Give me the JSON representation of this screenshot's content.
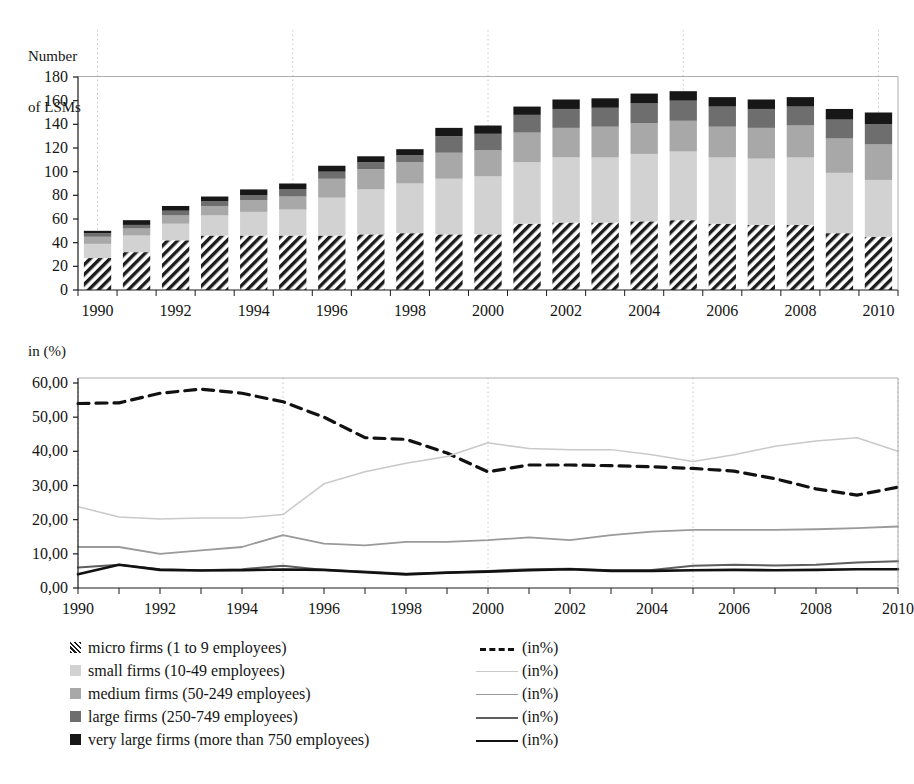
{
  "chart_data": [
    {
      "type": "bar",
      "stacked": true,
      "title": "",
      "ylabel": "Number\nof LSMs",
      "xlabel": "",
      "ylim": [
        0,
        180
      ],
      "yticks": [
        0,
        20,
        40,
        60,
        80,
        100,
        120,
        140,
        160,
        180
      ],
      "ytick_labels": [
        "0",
        "20",
        "40",
        "60",
        "80",
        "100",
        "120",
        "140",
        "160",
        "180"
      ],
      "categories": [
        1990,
        1991,
        1992,
        1993,
        1994,
        1995,
        1996,
        1997,
        1998,
        1999,
        2000,
        2001,
        2002,
        2003,
        2004,
        2005,
        2006,
        2007,
        2008,
        2009,
        2010
      ],
      "xtick_labels": [
        "1990",
        "1992",
        "1994",
        "1996",
        "1998",
        "2000",
        "2002",
        "2004",
        "2006",
        "2008",
        "2010"
      ],
      "grid": "vertical dotted every 5 years",
      "series": [
        {
          "name": "micro firms (1 to 9 employees)",
          "key": "micro",
          "fill": "hatch",
          "values": [
            27,
            32,
            42,
            46,
            46,
            46,
            46,
            47,
            48,
            47,
            47,
            56,
            57,
            57,
            58,
            59,
            56,
            55,
            55,
            48,
            45
          ]
        },
        {
          "name": "small firms (10-49 employees)",
          "key": "small",
          "fill": "#d2d2d2",
          "values": [
            12,
            14,
            14,
            17,
            20,
            22,
            32,
            38,
            42,
            47,
            49,
            52,
            55,
            55,
            57,
            58,
            56,
            56,
            57,
            51,
            48
          ]
        },
        {
          "name": "medium firms (50-249 employees)",
          "key": "medium",
          "fill": "#a8a8a8",
          "values": [
            6,
            6,
            7,
            8,
            10,
            11,
            16,
            17,
            18,
            22,
            22,
            25,
            25,
            26,
            26,
            26,
            26,
            26,
            27,
            29,
            30
          ]
        },
        {
          "name": "large firms (250-749 employees)",
          "key": "large",
          "fill": "#6e6e6e",
          "values": [
            3,
            3,
            4,
            4,
            4,
            6,
            6,
            6,
            6,
            14,
            14,
            15,
            16,
            16,
            17,
            17,
            17,
            16,
            16,
            16,
            17
          ]
        },
        {
          "name": "very large firms (more than 750 employees)",
          "key": "verylarge",
          "fill": "#171717",
          "values": [
            2,
            4,
            4,
            4,
            5,
            5,
            5,
            5,
            5,
            7,
            7,
            7,
            8,
            8,
            8,
            8,
            8,
            8,
            8,
            9,
            10
          ]
        }
      ],
      "totals": [
        50,
        59,
        71,
        79,
        85,
        90,
        105,
        113,
        119,
        137,
        139,
        155,
        161,
        162,
        166,
        168,
        163,
        161,
        163,
        153,
        150
      ]
    },
    {
      "type": "line",
      "title": "",
      "ylabel": "in (%)",
      "xlabel": "",
      "ylim": [
        0,
        60
      ],
      "yticks": [
        0,
        10,
        20,
        30,
        40,
        50,
        60
      ],
      "ytick_labels": [
        "0,00",
        "10,00",
        "20,00",
        "30,00",
        "40,00",
        "50,00",
        "60,00"
      ],
      "x": [
        1990,
        1991,
        1992,
        1993,
        1994,
        1995,
        1996,
        1997,
        1998,
        1999,
        2000,
        2001,
        2002,
        2003,
        2004,
        2005,
        2006,
        2007,
        2008,
        2009,
        2010
      ],
      "xtick_labels": [
        "1990",
        "1992",
        "1994",
        "1996",
        "1998",
        "2000",
        "2002",
        "2004",
        "2006",
        "2008",
        "2010"
      ],
      "grid": "vertical dotted every 5 years",
      "series": [
        {
          "name": "(in%)",
          "key": "micro_pct",
          "style": "dashed",
          "color": "#111111",
          "width": 3.2,
          "values": [
            54.0,
            54.2,
            57.0,
            58.2,
            57.0,
            54.5,
            50.0,
            44.0,
            43.5,
            39.5,
            34.0,
            36.0,
            36.0,
            35.8,
            35.5,
            35.0,
            34.2,
            32.0,
            29.0,
            27.2,
            29.5
          ]
        },
        {
          "name": "(in%)",
          "key": "small_pct",
          "style": "solid",
          "color": "#c9c9c9",
          "width": 1.5,
          "values": [
            23.8,
            20.8,
            20.2,
            20.5,
            20.5,
            21.5,
            30.5,
            34.0,
            36.5,
            38.5,
            42.5,
            40.8,
            40.5,
            40.5,
            39.0,
            37.0,
            39.0,
            41.5,
            43.0,
            44.0,
            40.0
          ]
        },
        {
          "name": "(in%)",
          "key": "medium_pct",
          "style": "solid",
          "color": "#9a9a9a",
          "width": 1.8,
          "values": [
            12.0,
            12.0,
            10.0,
            11.0,
            12.0,
            15.5,
            13.0,
            12.5,
            13.5,
            13.5,
            14.0,
            14.8,
            14.0,
            15.5,
            16.5,
            17.0,
            17.0,
            17.0,
            17.2,
            17.5,
            18.0
          ]
        },
        {
          "name": "(in%)",
          "key": "large_pct",
          "style": "solid",
          "color": "#5e5e5e",
          "width": 2.0,
          "values": [
            6.0,
            6.8,
            5.5,
            5.2,
            5.5,
            6.5,
            5.3,
            4.8,
            4.2,
            4.5,
            5.0,
            5.5,
            5.6,
            5.2,
            5.3,
            6.5,
            6.8,
            6.6,
            6.8,
            7.5,
            7.8
          ]
        },
        {
          "name": "(in%)",
          "key": "verylarge_pct",
          "style": "solid",
          "color": "#111111",
          "width": 2.6,
          "values": [
            4.0,
            6.8,
            5.3,
            5.1,
            5.2,
            5.4,
            5.3,
            4.6,
            4.0,
            4.5,
            4.8,
            5.2,
            5.5,
            5.0,
            5.0,
            5.2,
            5.3,
            5.2,
            5.3,
            5.5,
            5.5
          ]
        }
      ]
    }
  ],
  "top_chart": {
    "y_axis_title_line1": "Number",
    "y_axis_title_line2": "of LSMs"
  },
  "bottom_chart": {
    "y_axis_title": "in (%)"
  },
  "legend": {
    "left_items": [
      {
        "label": "micro firms (1 to 9 employees)",
        "swatch": "hatch"
      },
      {
        "label": "small firms (10-49 employees)",
        "swatch": "#d2d2d2"
      },
      {
        "label": "medium firms (50-249 employees)",
        "swatch": "#a8a8a8"
      },
      {
        "label": "large firms (250-749 employees)",
        "swatch": "#6e6e6e"
      },
      {
        "label": "very large firms (more than 750 employees)",
        "swatch": "#171717"
      }
    ],
    "right_items": [
      {
        "label": "(in%)",
        "style": "dashed",
        "color": "#111111",
        "width": 3.2
      },
      {
        "label": "(in%)",
        "style": "solid",
        "color": "#c9c9c9",
        "width": 1.5
      },
      {
        "label": "(in%)",
        "style": "solid",
        "color": "#9a9a9a",
        "width": 1.8
      },
      {
        "label": "(in%)",
        "style": "solid",
        "color": "#5e5e5e",
        "width": 2.0
      },
      {
        "label": "(in%)",
        "style": "solid",
        "color": "#111111",
        "width": 2.6
      }
    ]
  }
}
